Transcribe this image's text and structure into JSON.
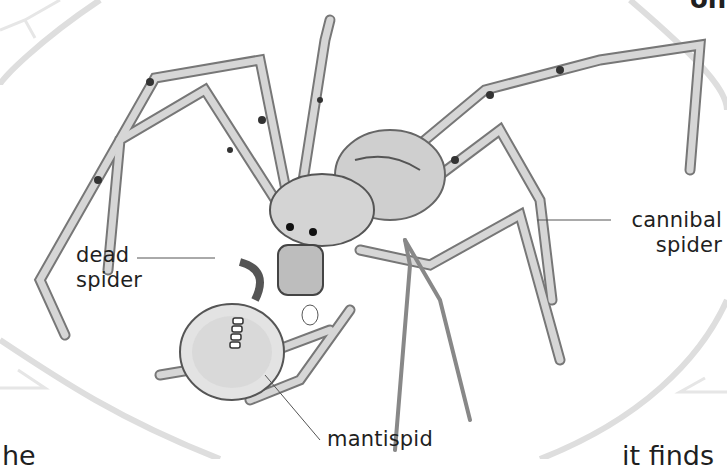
{
  "page": {
    "top_right_fragment": "on",
    "bottom_left_fragment": "he",
    "bottom_right_fragment": "it finds"
  },
  "illustration": {
    "subject": "cannibal spider eating a dead spider",
    "labels": {
      "dead_spider": [
        "dead",
        "spider"
      ],
      "cannibal_spider": [
        "cannibal",
        "spider"
      ],
      "mantispid": "mantispid"
    }
  },
  "colors": {
    "background": "#ffffff",
    "frame": "#dcdcdc",
    "ink": "#1f1f1f",
    "leader_line": "#555555",
    "leg_fill": "#d9d9d9",
    "leg_stroke": "#6a6a6a"
  }
}
